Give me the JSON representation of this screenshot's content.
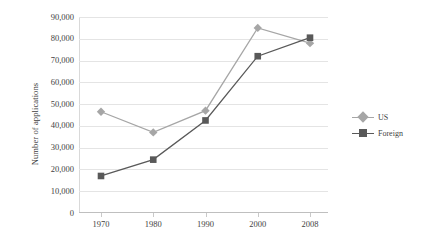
{
  "chart_data": {
    "type": "line",
    "title": "",
    "xlabel": "",
    "ylabel": "Number of applications",
    "categories": [
      "1970",
      "1980",
      "1990",
      "2000",
      "2008"
    ],
    "ylim": [
      0,
      90000
    ],
    "ytick_step": 10000,
    "ytick_labels": [
      "0",
      "10,000",
      "20,000",
      "30,000",
      "40,000",
      "50,000",
      "60,000",
      "70,000",
      "80,000",
      "90,000"
    ],
    "grid": "horizontal",
    "legend_position": "right",
    "series": [
      {
        "name": "US",
        "color": "#a6a6a6",
        "marker": "diamond",
        "values": [
          46500,
          37000,
          47000,
          85000,
          78000
        ]
      },
      {
        "name": "Foreign",
        "color": "#595959",
        "marker": "square",
        "values": [
          17000,
          24500,
          42500,
          72000,
          80500
        ]
      }
    ]
  },
  "legend": {
    "items": [
      {
        "label": "US"
      },
      {
        "label": "Foreign"
      }
    ]
  },
  "axis": {
    "y_title": "Number of applications"
  },
  "colors": {
    "us": "#a6a6a6",
    "foreign": "#595959",
    "gridline": "#e4e4e4",
    "axis": "#bfbfbf",
    "text": "#3f3f3f",
    "background": "#ffffff"
  }
}
